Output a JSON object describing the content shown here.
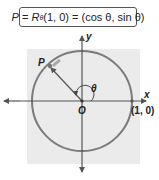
{
  "formula": {
    "lhs_point": "P",
    "equals1": " = ",
    "rotation": "R",
    "rotation_sub": "θ",
    "args": "(1, 0)",
    "equals2": " = ",
    "rhs": "(cos θ, sin θ)"
  },
  "diagram": {
    "axis_x_label": "x",
    "axis_y_label": "y",
    "origin_label": "O",
    "point_label": "P",
    "angle_label": "θ",
    "unit_point_label": "(1, 0)",
    "colors": {
      "background_square": "#ebebeb",
      "circle": "#7a7a7a",
      "axes": "#555555",
      "radius_arrow": "#555555",
      "point_marker": "#888888"
    }
  }
}
